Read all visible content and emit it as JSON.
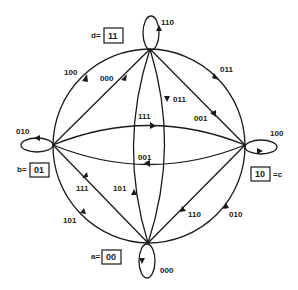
{
  "diagram": {
    "type": "state-transition-diagram",
    "states": [
      {
        "id": "a",
        "prefix": "a=",
        "code": "00",
        "position": "bottom",
        "self_loop": "000"
      },
      {
        "id": "b",
        "prefix": "b=",
        "code": "01",
        "position": "left",
        "self_loop": "010"
      },
      {
        "id": "c",
        "suffix": "=c",
        "code": "10",
        "position": "right",
        "self_loop": "100"
      },
      {
        "id": "d",
        "prefix": "d=",
        "code": "11",
        "position": "top",
        "self_loop": "110"
      }
    ],
    "transitions": [
      {
        "from": "b",
        "to": "d",
        "label": "100",
        "path": "outer-arc-left-top"
      },
      {
        "from": "b",
        "to": "d",
        "label": "000",
        "path": "chord"
      },
      {
        "from": "d",
        "to": "c",
        "label": "011",
        "path": "outer-arc-top-right"
      },
      {
        "from": "d",
        "to": "c",
        "label": "001",
        "path": "chord"
      },
      {
        "from": "d",
        "to": "a",
        "label": "011",
        "path": "inner-arc-right"
      },
      {
        "from": "a",
        "to": "d",
        "label": "101",
        "path": "inner-arc-left"
      },
      {
        "from": "b",
        "to": "c",
        "label": "111",
        "path": "inner-arc-top"
      },
      {
        "from": "c",
        "to": "b",
        "label": "001",
        "path": "inner-arc-bottom"
      },
      {
        "from": "a",
        "to": "b",
        "label": "111",
        "path": "chord"
      },
      {
        "from": "b",
        "to": "a",
        "label": "101",
        "path": "outer-arc-left-bottom"
      },
      {
        "from": "c",
        "to": "a",
        "label": "110",
        "path": "chord"
      },
      {
        "from": "a",
        "to": "c",
        "label": "010",
        "path": "outer-arc-bottom-right"
      }
    ],
    "labels": {
      "d_prefix": "d=",
      "d_code": "11",
      "b_prefix": "b=",
      "b_code": "01",
      "c_suffix": "=c",
      "c_code": "10",
      "a_prefix": "a=",
      "a_code": "00",
      "loop_d": "110",
      "loop_b": "010",
      "loop_c": "100",
      "loop_a": "000",
      "e_bd_outer": "100",
      "e_bd_chord": "000",
      "e_dc_outer": "011",
      "e_dc_chord": "001",
      "e_da_inner": "011",
      "e_ad_inner": "101",
      "e_bc_top": "111",
      "e_cb_bottom": "001",
      "e_ab_chord": "111",
      "e_ba_outer": "101",
      "e_ca_chord": "110",
      "e_ac_outer": "010"
    },
    "colors": {
      "ink": "#1a1a1a",
      "background": "#ffffff"
    }
  }
}
